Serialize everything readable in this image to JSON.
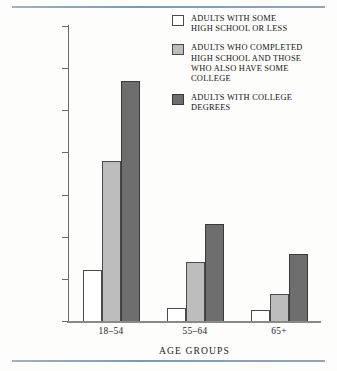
{
  "chart_data": {
    "type": "bar",
    "title": "",
    "subtitle": "",
    "xlabel": "AGE GROUPS",
    "ylabel": "PERCENT OF ADULTS ENROLLED IN AT LEAST\nONE \"ADULT EDUCATION\" CLASS (SCHOOL, AT WORK,\nOR ELSEWHERE) IN 1981",
    "categories": [
      "18–54",
      "55–64",
      "65+"
    ],
    "series": [
      {
        "name": "ADULTS WITH SOME\nHIGH SCHOOL OR LESS",
        "color": "#ffffff",
        "values": [
          12,
          3,
          2.5
        ]
      },
      {
        "name": "ADULTS WHO COMPLETED\nHIGH SCHOOL AND THOSE\nWHO ALSO HAVE SOME\nCOLLEGE",
        "color": "#bdbdbd",
        "values": [
          38,
          14,
          6.5
        ]
      },
      {
        "name": "ADULTS WITH COLLEGE\nDEGREES",
        "color": "#6e6e6e",
        "values": [
          57,
          23,
          16
        ]
      }
    ],
    "ylim": [
      0,
      70
    ],
    "yticks": [
      0,
      10,
      20,
      30,
      40,
      50,
      60,
      70
    ],
    "ytick_labels": [
      "0",
      "10",
      "20",
      "30",
      "40",
      "50",
      "60",
      "70"
    ],
    "grid": false,
    "legend_position": "top-right",
    "annotations": []
  },
  "figure": {
    "rule_color": "#8fa6b8",
    "axis_color": "#6a6a6a",
    "background": "#fdfdfb"
  }
}
